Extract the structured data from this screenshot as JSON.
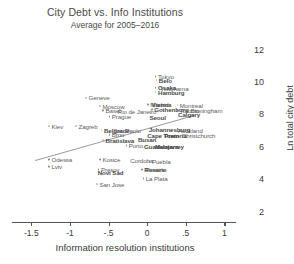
{
  "chart_data": {
    "type": "scatter",
    "title": "City Debt vs. Info Institutions",
    "subtitle": "Average for 2005–2016",
    "xlabel": "Information resolution institutions",
    "ylabel": "Ln total city debt",
    "xlim": [
      -1.75,
      1.15
    ],
    "ylim": [
      1.6,
      12.6
    ],
    "xticks": [
      "-1.5",
      "-1",
      "-.5",
      "0",
      ".5",
      "1"
    ],
    "xtickvals": [
      -1.5,
      -1.0,
      -0.5,
      0.0,
      0.5,
      1.0
    ],
    "yticks": [
      "12",
      "10",
      "8",
      "6",
      "4",
      "2"
    ],
    "ytickvals": [
      12,
      10,
      8,
      6,
      4,
      2
    ],
    "grid": false,
    "legend": "none",
    "yaxis_position": "right",
    "fit_line": {
      "type": "linear-fit",
      "x0": -1.45,
      "y0": 5.15,
      "x1": 0.62,
      "y1": 7.95
    },
    "points": [
      {
        "label": "Tokyo",
        "x": 0.1,
        "y": 10.35,
        "bold": false
      },
      {
        "label": "Belo",
        "x": 0.11,
        "y": 10.15,
        "bold": true
      },
      {
        "label": "Osaka",
        "x": 0.1,
        "y": 9.7,
        "bold": true
      },
      {
        "label": "Yokohama",
        "x": 0.17,
        "y": 9.65,
        "bold": false,
        "nodot": true
      },
      {
        "label": "Hamburg",
        "x": 0.1,
        "y": 9.4,
        "bold": true
      },
      {
        "label": "Madrid",
        "x": 0.0,
        "y": 8.62,
        "bold": false
      },
      {
        "label": "Vienna",
        "x": 0.06,
        "y": 8.62,
        "bold": true,
        "nodot": true
      },
      {
        "label": "Montreal",
        "x": 0.38,
        "y": 8.6,
        "bold": false
      },
      {
        "label": "Gothenburg",
        "x": 0.05,
        "y": 8.32,
        "bold": true
      },
      {
        "label": "Toronto",
        "x": 0.38,
        "y": 8.25,
        "bold": false
      },
      {
        "label": "Birmingham",
        "x": 0.56,
        "y": 8.25,
        "bold": false,
        "nodot": true
      },
      {
        "label": "Calgary",
        "x": 0.4,
        "y": 8.05,
        "bold": true,
        "nodot": true
      },
      {
        "label": "Geneve",
        "x": -0.8,
        "y": 9.05,
        "bold": false
      },
      {
        "label": "Moscow",
        "x": -0.62,
        "y": 8.55,
        "bold": false
      },
      {
        "label": "Basel",
        "x": -0.58,
        "y": 8.28,
        "bold": false
      },
      {
        "label": "Rio de Janeiro",
        "x": -0.38,
        "y": 8.22,
        "bold": false,
        "nodot": true
      },
      {
        "label": "Prague",
        "x": -0.5,
        "y": 7.9,
        "bold": false
      },
      {
        "label": "Seoul",
        "x": 0.03,
        "y": 7.85,
        "bold": true,
        "nodot": true
      },
      {
        "label": "Kiev",
        "x": -1.28,
        "y": 7.3,
        "bold": false
      },
      {
        "label": "Zagreb",
        "x": -0.93,
        "y": 7.3,
        "bold": false
      },
      {
        "label": "Belgrade",
        "x": -0.6,
        "y": 7.05,
        "bold": true
      },
      {
        "label": "Sao Paolo",
        "x": -0.44,
        "y": 7.05,
        "bold": false,
        "nodot": true
      },
      {
        "label": "Johannesburg",
        "x": 0.02,
        "y": 7.08,
        "bold": true,
        "nodot": true
      },
      {
        "label": "Auckland",
        "x": 0.4,
        "y": 7.05,
        "bold": false,
        "nodot": true
      },
      {
        "label": "Brno",
        "x": -0.5,
        "y": 6.78,
        "bold": false
      },
      {
        "label": "Cape Town",
        "x": 0.0,
        "y": 6.72,
        "bold": true,
        "nodot": true
      },
      {
        "label": "Pretoria",
        "x": 0.22,
        "y": 6.72,
        "bold": true,
        "nodot": true
      },
      {
        "label": "Christchurch",
        "x": 0.45,
        "y": 6.7,
        "bold": false,
        "nodot": true
      },
      {
        "label": "Bratislava",
        "x": -0.58,
        "y": 6.45,
        "bold": true
      },
      {
        "label": "Busan",
        "x": -0.12,
        "y": 6.48,
        "bold": true,
        "nodot": true
      },
      {
        "label": "Porto",
        "x": -0.28,
        "y": 6.1,
        "bold": false
      },
      {
        "label": "Guadalajara",
        "x": -0.04,
        "y": 6.08,
        "bold": true,
        "nodot": true
      },
      {
        "label": "Monterrey",
        "x": 0.1,
        "y": 6.02,
        "bold": true,
        "nodot": true
      },
      {
        "label": "Odessa",
        "x": -1.28,
        "y": 5.25,
        "bold": false
      },
      {
        "label": "Kosice",
        "x": -0.62,
        "y": 5.22,
        "bold": false
      },
      {
        "label": "Cordoba",
        "x": -0.22,
        "y": 5.18,
        "bold": false,
        "nodot": true
      },
      {
        "label": "Puebla",
        "x": 0.02,
        "y": 5.1,
        "bold": false
      },
      {
        "label": "Lviv",
        "x": -1.28,
        "y": 4.82,
        "bold": false
      },
      {
        "label": "Presov",
        "x": -0.64,
        "y": 4.62,
        "bold": false
      },
      {
        "label": "Rosario",
        "x": -0.08,
        "y": 4.62,
        "bold": true
      },
      {
        "label": "Pereira",
        "x": -0.02,
        "y": 4.6,
        "bold": false,
        "nodot": true
      },
      {
        "label": "Novi Sad",
        "x": -0.64,
        "y": 4.42,
        "bold": true,
        "nodot": true
      },
      {
        "label": "La Plata",
        "x": -0.06,
        "y": 4.05,
        "bold": false
      },
      {
        "label": "San Jose",
        "x": -0.66,
        "y": 3.72,
        "bold": false
      }
    ]
  }
}
